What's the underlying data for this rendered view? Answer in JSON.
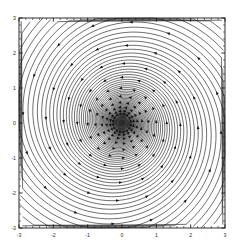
{
  "figure": {
    "title": "",
    "background_color": "#ffffff",
    "width": 241,
    "height": 248
  },
  "plot_area": {
    "left": 19,
    "top": 18,
    "right": 225,
    "bottom": 228,
    "frame_color": "#1a1a1a",
    "fill_color": "#ffffff"
  },
  "axes": {
    "x": {
      "label": "",
      "min": -3,
      "max": 3,
      "major_ticks": [
        -3,
        -2,
        -1,
        0,
        1,
        2,
        3
      ],
      "major_tick_labels": [
        "-3",
        "-2",
        "-1",
        "0",
        "1",
        "2",
        "3"
      ],
      "minor_tick_step": 0.2,
      "tick_direction": "in"
    },
    "y": {
      "label": "",
      "min": -3,
      "max": 3,
      "major_ticks": [
        -3,
        -2,
        -1,
        0,
        1,
        2,
        3
      ],
      "major_tick_labels": [
        "-3",
        "-2",
        "-1",
        "0",
        "1",
        "2",
        "3"
      ],
      "minor_tick_step": 0.2,
      "tick_direction": "in"
    }
  },
  "chart_data": {
    "type": "line",
    "title": "",
    "xlabel": "",
    "ylabel": "",
    "xlim": [
      -3,
      3
    ],
    "ylim": [
      -3,
      3
    ],
    "grid": false,
    "legend": "none",
    "plot_kind": "phase-portrait",
    "equilibrium": {
      "type": "stable-spiral-focus",
      "x": 0,
      "y": 0
    },
    "spiral": {
      "num_trajectories": 16,
      "direction": "counterclockwise-inward",
      "r0": 4.35,
      "decay_b": 0.1335,
      "theta_start": 0.0,
      "theta_end": 25.5,
      "theta_step": 0.05,
      "arrow_count_per_curve": 11,
      "arrow_theta_start": 1.05,
      "arrow_theta_end": 21.0,
      "arrow_size": 2.25,
      "line_color": "#141414",
      "arrow_color": "#111111"
    },
    "focus_blob": {
      "outer_radius": 5.6,
      "inner_radius": 3.2,
      "outer_color": "#3a3a3a",
      "inner_color": "#2a2a2a"
    },
    "series": [
      {
        "name": "trajectory-1",
        "phase_offset_deg": 0
      },
      {
        "name": "trajectory-2",
        "phase_offset_deg": 22.5
      },
      {
        "name": "trajectory-3",
        "phase_offset_deg": 45
      },
      {
        "name": "trajectory-4",
        "phase_offset_deg": 67.5
      },
      {
        "name": "trajectory-5",
        "phase_offset_deg": 90
      },
      {
        "name": "trajectory-6",
        "phase_offset_deg": 112.5
      },
      {
        "name": "trajectory-7",
        "phase_offset_deg": 135
      },
      {
        "name": "trajectory-8",
        "phase_offset_deg": 157.5
      },
      {
        "name": "trajectory-9",
        "phase_offset_deg": 180
      },
      {
        "name": "trajectory-10",
        "phase_offset_deg": 202.5
      },
      {
        "name": "trajectory-11",
        "phase_offset_deg": 225
      },
      {
        "name": "trajectory-12",
        "phase_offset_deg": 247.5
      },
      {
        "name": "trajectory-13",
        "phase_offset_deg": 270
      },
      {
        "name": "trajectory-14",
        "phase_offset_deg": 292.5
      },
      {
        "name": "trajectory-15",
        "phase_offset_deg": 315
      },
      {
        "name": "trajectory-16",
        "phase_offset_deg": 337.5
      }
    ]
  }
}
